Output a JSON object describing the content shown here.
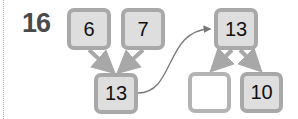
{
  "question_number": "16",
  "left_tree": {
    "top_left": "6",
    "top_right": "7",
    "sum": "13"
  },
  "right_tree": {
    "whole": "13",
    "part_left": "",
    "part_right": "10"
  },
  "colors": {
    "box_fill": "#dedede",
    "box_border": "#a8a8a8",
    "arrow": "#a8a8a8",
    "connector": "#777777"
  }
}
